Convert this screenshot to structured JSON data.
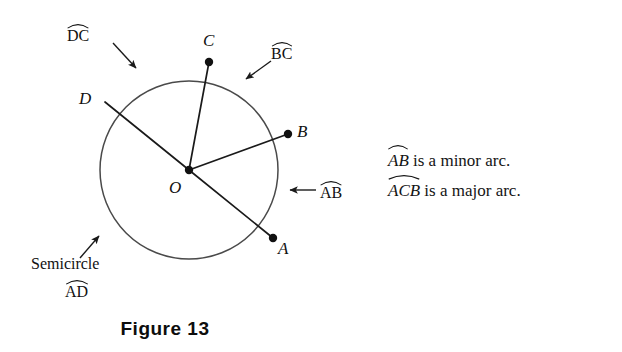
{
  "figure": {
    "caption": "Figure 13",
    "circle": {
      "center_label": "O",
      "cx": 189,
      "cy": 170,
      "r": 89,
      "stroke": "#3a3a3a"
    },
    "points": [
      {
        "id": "A",
        "label": "A",
        "x": 273,
        "y": 238,
        "dot": true,
        "label_x": 278,
        "label_y": 240
      },
      {
        "id": "B",
        "label": "B",
        "x": 288,
        "y": 134,
        "dot": true,
        "label_x": 296,
        "label_y": 124
      },
      {
        "id": "C",
        "label": "C",
        "x": 209,
        "y": 62,
        "dot": true,
        "label_x": 203,
        "label_y": 32
      },
      {
        "id": "D",
        "label": "D",
        "x": 105,
        "y": 102,
        "dot": false,
        "label_x": 80,
        "label_y": 90
      },
      {
        "id": "O",
        "label": "O",
        "x": 189,
        "y": 170,
        "dot": true,
        "label_x": 170,
        "label_y": 178
      }
    ],
    "radii": [
      {
        "from": "O",
        "to": "A"
      },
      {
        "from": "O",
        "to": "B"
      },
      {
        "from": "O",
        "to": "C"
      },
      {
        "from": "O",
        "to": "D"
      }
    ],
    "arc_callouts": [
      {
        "name": "arc-dc",
        "text": "DC",
        "label_x": 68,
        "label_y": 26,
        "arrow": {
          "x1": 113,
          "y1": 43,
          "x2": 134,
          "y2": 66
        }
      },
      {
        "name": "arc-bc",
        "text": "BC",
        "label_x": 272,
        "label_y": 44,
        "arrow": {
          "x1": 269,
          "y1": 62,
          "x2": 247,
          "y2": 78
        }
      },
      {
        "name": "arc-ab",
        "text": "AB",
        "label_x": 319,
        "label_y": 183,
        "arrow": {
          "x1": 315,
          "y1": 190,
          "x2": 289,
          "y2": 190
        }
      }
    ],
    "semicircle_callout": {
      "name": "semicircle-ad",
      "word": "Semicircle",
      "arc_text": "AD",
      "word_x": 32,
      "word_y": 258,
      "arc_x": 65,
      "arc_y": 282,
      "arrow": {
        "x1": 81,
        "y1": 257,
        "x2": 99,
        "y2": 237
      }
    }
  },
  "explanation": {
    "line1_arc": "AB",
    "line1_rest": " is a minor arc.",
    "line2_arc": "ACB",
    "line2_rest": " is a major arc."
  }
}
